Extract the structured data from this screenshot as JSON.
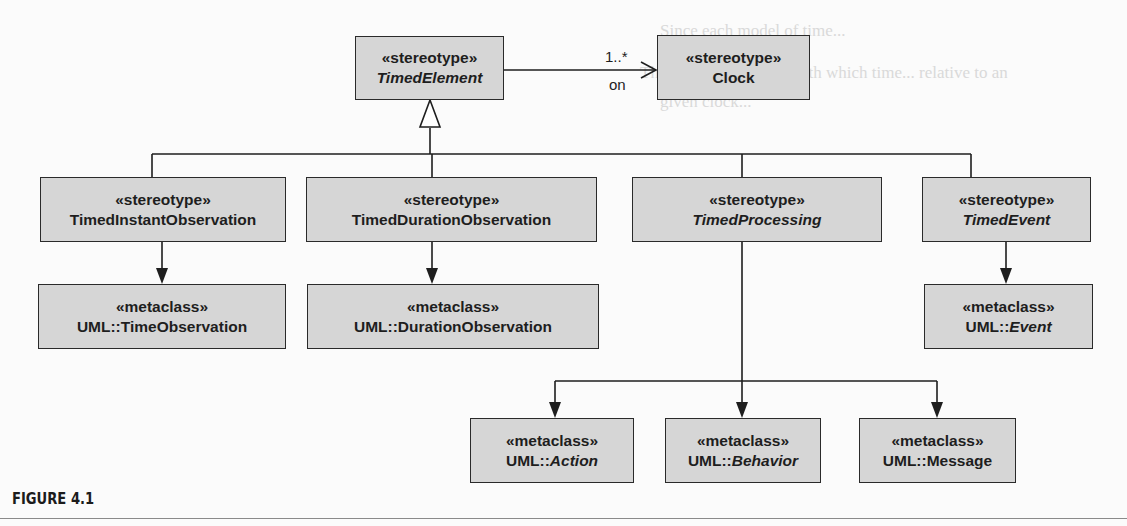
{
  "figure": {
    "caption": "FIGURE 4.1"
  },
  "nodes": {
    "timed_element": {
      "stereotype": "«stereotype»",
      "name": "TimedElement",
      "italic": true
    },
    "clock": {
      "stereotype": "«stereotype»",
      "name": "Clock",
      "italic": false
    },
    "timed_instant_observation": {
      "stereotype": "«stereotype»",
      "name": "TimedInstantObservation",
      "italic": false
    },
    "timed_duration_observation": {
      "stereotype": "«stereotype»",
      "name": "TimedDurationObservation",
      "italic": false
    },
    "timed_processing": {
      "stereotype": "«stereotype»",
      "name": "TimedProcessing",
      "italic": true
    },
    "timed_event": {
      "stereotype": "«stereotype»",
      "name": "TimedEvent",
      "italic": true
    },
    "time_observation": {
      "stereotype": "«metaclass»",
      "prefix": "UML::",
      "name": "TimeObservation",
      "italic": false
    },
    "duration_observation": {
      "stereotype": "«metaclass»",
      "prefix": "UML::",
      "name": "DurationObservation",
      "italic": false
    },
    "event": {
      "stereotype": "«metaclass»",
      "prefix": "UML::",
      "name": "Event",
      "italic": true
    },
    "action": {
      "stereotype": "«metaclass»",
      "prefix": "UML::",
      "name": "Action",
      "italic": true
    },
    "behavior": {
      "stereotype": "«metaclass»",
      "prefix": "UML::",
      "name": "Behavior",
      "italic": true
    },
    "message": {
      "stereotype": "«metaclass»",
      "prefix": "UML::",
      "name": "Message",
      "italic": false
    }
  },
  "association": {
    "multiplicity": "1..*",
    "role": "on",
    "from": "TimedElement",
    "to": "Clock"
  },
  "generalizations": [
    {
      "child": "TimedInstantObservation",
      "parent": "TimedElement"
    },
    {
      "child": "TimedDurationObservation",
      "parent": "TimedElement"
    },
    {
      "child": "TimedProcessing",
      "parent": "TimedElement"
    },
    {
      "child": "TimedEvent",
      "parent": "TimedElement"
    }
  ],
  "extensions": [
    {
      "stereotype": "TimedInstantObservation",
      "metaclass": "UML::TimeObservation"
    },
    {
      "stereotype": "TimedDurationObservation",
      "metaclass": "UML::DurationObservation"
    },
    {
      "stereotype": "TimedEvent",
      "metaclass": "UML::Event"
    },
    {
      "stereotype": "TimedProcessing",
      "metaclass": "UML::Action"
    },
    {
      "stereotype": "TimedProcessing",
      "metaclass": "UML::Behavior"
    },
    {
      "stereotype": "TimedProcessing",
      "metaclass": "UML::Message"
    }
  ],
  "colors": {
    "box_fill": "#d6d6d6",
    "box_border": "#2a2a2a",
    "line": "#1e1e1e",
    "background": "#fbfbfb"
  },
  "bleed_through_text": [
    "Since each model of time...",
    "The system is the one with which time... relative to an",
    "given clock..."
  ]
}
